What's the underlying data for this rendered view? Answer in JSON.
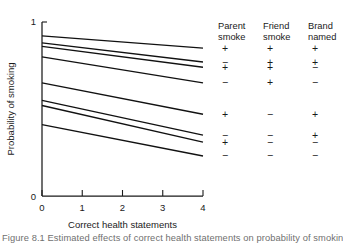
{
  "figure": {
    "caption": "Figure 8.1 Estimated effects of correct health statements on probability of smoking"
  },
  "chart_data": {
    "type": "line",
    "title": "",
    "xlabel": "Correct health statements",
    "ylabel": "Probability of smoking",
    "xlim": [
      0,
      4
    ],
    "ylim": [
      0,
      1
    ],
    "xticks": [
      "0",
      "1",
      "2",
      "3",
      "4"
    ],
    "xtick_values": [
      0,
      1,
      2,
      3,
      4
    ],
    "yticks": [
      "0",
      "1"
    ],
    "ytick_values": [
      0,
      1
    ],
    "grid": false,
    "legend_position": "right",
    "legend_headers": [
      "Parent smoke",
      "Friend smoke",
      "Brand named"
    ],
    "legend_header_lines": [
      [
        "Parent",
        "smoke"
      ],
      [
        "Friend",
        "smoke"
      ],
      [
        "Brand",
        "named"
      ]
    ],
    "x": [
      0,
      4
    ],
    "series": [
      {
        "name": "line-1",
        "parent_smoke": "+",
        "friend_smoke": "+",
        "brand_named": "+",
        "values": [
          0.92,
          0.85
        ]
      },
      {
        "name": "line-2",
        "parent_smoke": "−",
        "friend_smoke": "+",
        "brand_named": "+",
        "values": [
          0.88,
          0.77
        ]
      },
      {
        "name": "line-3",
        "parent_smoke": "+",
        "friend_smoke": "+",
        "brand_named": "−",
        "values": [
          0.86,
          0.74
        ]
      },
      {
        "name": "line-4",
        "parent_smoke": "−",
        "friend_smoke": "+",
        "brand_named": "−",
        "values": [
          0.8,
          0.65
        ]
      },
      {
        "name": "line-5",
        "parent_smoke": "+",
        "friend_smoke": "−",
        "brand_named": "+",
        "values": [
          0.65,
          0.47
        ]
      },
      {
        "name": "line-6",
        "parent_smoke": "−",
        "friend_smoke": "−",
        "brand_named": "+",
        "values": [
          0.55,
          0.35
        ]
      },
      {
        "name": "line-7",
        "parent_smoke": "+",
        "friend_smoke": "−",
        "brand_named": "−",
        "values": [
          0.52,
          0.31
        ]
      },
      {
        "name": "line-8",
        "parent_smoke": "−",
        "friend_smoke": "−",
        "brand_named": "−",
        "values": [
          0.41,
          0.23
        ]
      }
    ],
    "legend_rows": [
      {
        "row": 1,
        "parent_smoke": "+",
        "friend_smoke": "+",
        "brand_named": "+"
      },
      {
        "row": 2,
        "parent_smoke": "−",
        "friend_smoke": "+",
        "brand_named": "+"
      },
      {
        "row": 3,
        "parent_smoke": "+",
        "friend_smoke": "+",
        "brand_named": "−"
      },
      {
        "row": 4,
        "parent_smoke": "−",
        "friend_smoke": "+",
        "brand_named": "−"
      },
      {
        "row": 5,
        "parent_smoke": "+",
        "friend_smoke": "−",
        "brand_named": "+"
      },
      {
        "row": 6,
        "parent_smoke": "−",
        "friend_smoke": "−",
        "brand_named": "+"
      },
      {
        "row": 7,
        "parent_smoke": "+",
        "friend_smoke": "−",
        "brand_named": "−"
      },
      {
        "row": 8,
        "parent_smoke": "−",
        "friend_smoke": "−",
        "brand_named": "−"
      }
    ],
    "colors": {
      "line": "#111111",
      "axis": "#1a1a1a",
      "background": "#ffffff",
      "caption": "#6f6f6f"
    }
  }
}
